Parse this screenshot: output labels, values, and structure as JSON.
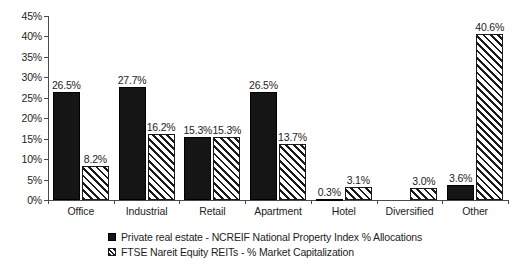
{
  "chart_data": {
    "type": "bar",
    "title": "",
    "subtitle": "",
    "xlabel": "",
    "ylabel": "",
    "grid": false,
    "legend_position": "bottom",
    "ylim": [
      0,
      45
    ],
    "ytick_labels": [
      "0%",
      "5%",
      "10%",
      "15%",
      "20%",
      "25%",
      "30%",
      "35%",
      "40%",
      "45%"
    ],
    "ytick_values": [
      0,
      5,
      10,
      15,
      20,
      25,
      30,
      35,
      40,
      45
    ],
    "categories": [
      "Office",
      "Industrial",
      "Retail",
      "Apartment",
      "Hotel",
      "Diversified",
      "Other"
    ],
    "series": [
      {
        "name": "Private real estate - NCREIF National Property Index % Allocations",
        "pattern": "solid",
        "values": [
          26.5,
          27.7,
          15.3,
          26.5,
          0.3,
          0.0,
          3.6
        ],
        "labels": [
          "26.5%",
          "27.7%",
          "15.3%",
          "26.5%",
          "0.3%",
          "",
          "3.6%"
        ]
      },
      {
        "name": "FTSE Nareit Equity REITs - % Market Capitalization",
        "pattern": "hatch",
        "values": [
          8.2,
          16.2,
          15.3,
          13.7,
          3.1,
          3.0,
          40.6
        ],
        "labels": [
          "8.2%",
          "16.2%",
          "15.3%",
          "13.7%",
          "3.1%",
          "3.0%",
          "40.6%"
        ]
      }
    ]
  },
  "colors": {
    "series_solid": "#151515",
    "series_hatch_line": "#1a1a1a",
    "axis": "#4a4a4a",
    "text": "#1d1d1d",
    "background": "#ffffff"
  }
}
